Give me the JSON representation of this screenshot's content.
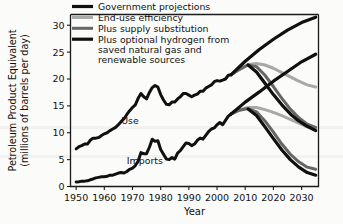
{
  "chart_data": {
    "type": "line",
    "title": "",
    "xlabel": "Year",
    "ylabel": "Petroleum Product Equivalent (millions of barrels per day)",
    "ylabel_line1": "Petroleum Product Equivalent",
    "ylabel_line2": "(millions of barrels per day)",
    "xlim": [
      1948,
      2036
    ],
    "ylim": [
      0,
      32
    ],
    "grid": false,
    "legend_position": "top-left-inside",
    "xticks": [
      1950,
      1960,
      1970,
      1980,
      1990,
      2000,
      2010,
      2020,
      2030
    ],
    "xtick_labels": [
      "1950",
      "1960",
      "1970",
      "1980",
      "1990",
      "2000",
      "2010",
      "2020",
      "2030"
    ],
    "yticks": [
      0,
      5,
      10,
      15,
      20,
      25,
      30
    ],
    "ytick_labels": [
      "0",
      "5",
      "10",
      "15",
      "20",
      "25",
      "30"
    ],
    "annotations": [
      {
        "text": "Use",
        "x": 1966,
        "y": 11.6
      },
      {
        "text": "Imports",
        "x": 1968,
        "y": 4.2
      }
    ],
    "legend": [
      {
        "label": "Government projections",
        "color": "#101010",
        "width": 3.2
      },
      {
        "label": "End-use efficiency",
        "color": "#a8a8a8",
        "width": 3.0
      },
      {
        "label": "Plus supply substitution",
        "color": "#666666",
        "width": 3.0
      },
      {
        "label": "Plus optional hydrogen from saved natural gas and renewable sources",
        "color": "#101010",
        "width": 3.2
      }
    ],
    "legend_labels_wrapped": [
      [
        "Government projections"
      ],
      [
        "End-use efficiency"
      ],
      [
        "Plus supply substitution"
      ],
      [
        "Plus optional hydrogen from",
        "saved natural gas and",
        "renewable sources"
      ]
    ],
    "series": [
      {
        "name": "Use (historical)",
        "color": "#101010",
        "width": 3.0,
        "points": [
          [
            1950,
            7.0
          ],
          [
            1951,
            7.4
          ],
          [
            1952,
            7.6
          ],
          [
            1953,
            7.9
          ],
          [
            1954,
            7.9
          ],
          [
            1955,
            8.6
          ],
          [
            1956,
            9.0
          ],
          [
            1957,
            9.0
          ],
          [
            1958,
            9.1
          ],
          [
            1959,
            9.5
          ],
          [
            1960,
            9.8
          ],
          [
            1961,
            10.0
          ],
          [
            1962,
            10.4
          ],
          [
            1963,
            10.7
          ],
          [
            1964,
            11.0
          ],
          [
            1965,
            11.5
          ],
          [
            1966,
            12.1
          ],
          [
            1967,
            12.6
          ],
          [
            1968,
            13.4
          ],
          [
            1969,
            14.1
          ],
          [
            1970,
            14.7
          ],
          [
            1971,
            15.2
          ],
          [
            1972,
            16.4
          ],
          [
            1973,
            17.3
          ],
          [
            1974,
            16.7
          ],
          [
            1975,
            16.3
          ],
          [
            1976,
            17.5
          ],
          [
            1977,
            18.4
          ],
          [
            1978,
            18.8
          ],
          [
            1979,
            18.5
          ],
          [
            1980,
            17.1
          ],
          [
            1981,
            16.1
          ],
          [
            1982,
            15.3
          ],
          [
            1983,
            15.2
          ],
          [
            1984,
            15.7
          ],
          [
            1985,
            15.7
          ],
          [
            1986,
            16.3
          ],
          [
            1987,
            16.7
          ],
          [
            1988,
            17.3
          ],
          [
            1989,
            17.3
          ],
          [
            1990,
            17.0
          ],
          [
            1991,
            16.7
          ],
          [
            1992,
            17.0
          ],
          [
            1993,
            17.2
          ],
          [
            1994,
            17.7
          ],
          [
            1995,
            17.7
          ],
          [
            1996,
            18.3
          ],
          [
            1997,
            18.6
          ],
          [
            1998,
            18.9
          ],
          [
            1999,
            19.5
          ],
          [
            2000,
            19.7
          ],
          [
            2001,
            19.6
          ],
          [
            2002,
            19.8
          ],
          [
            2003,
            20.0
          ],
          [
            2004,
            20.7
          ],
          [
            2005,
            20.8
          ]
        ]
      },
      {
        "name": "Imports (historical)",
        "color": "#101010",
        "width": 3.0,
        "points": [
          [
            1950,
            0.85
          ],
          [
            1951,
            0.9
          ],
          [
            1952,
            1.0
          ],
          [
            1953,
            1.0
          ],
          [
            1954,
            1.05
          ],
          [
            1955,
            1.25
          ],
          [
            1956,
            1.4
          ],
          [
            1957,
            1.6
          ],
          [
            1958,
            1.7
          ],
          [
            1959,
            1.8
          ],
          [
            1960,
            1.8
          ],
          [
            1961,
            1.9
          ],
          [
            1962,
            2.1
          ],
          [
            1963,
            2.1
          ],
          [
            1964,
            2.3
          ],
          [
            1965,
            2.5
          ],
          [
            1966,
            2.6
          ],
          [
            1967,
            2.5
          ],
          [
            1968,
            2.8
          ],
          [
            1969,
            3.2
          ],
          [
            1970,
            3.4
          ],
          [
            1971,
            3.9
          ],
          [
            1972,
            4.7
          ],
          [
            1973,
            6.3
          ],
          [
            1974,
            6.1
          ],
          [
            1975,
            6.1
          ],
          [
            1976,
            7.3
          ],
          [
            1977,
            8.8
          ],
          [
            1978,
            8.4
          ],
          [
            1979,
            8.5
          ],
          [
            1980,
            6.9
          ],
          [
            1981,
            6.0
          ],
          [
            1982,
            5.1
          ],
          [
            1983,
            5.0
          ],
          [
            1984,
            5.4
          ],
          [
            1985,
            5.1
          ],
          [
            1986,
            6.2
          ],
          [
            1987,
            6.7
          ],
          [
            1988,
            7.4
          ],
          [
            1989,
            8.1
          ],
          [
            1990,
            8.0
          ],
          [
            1991,
            7.6
          ],
          [
            1992,
            7.9
          ],
          [
            1993,
            8.6
          ],
          [
            1994,
            9.0
          ],
          [
            1995,
            8.8
          ],
          [
            1996,
            9.5
          ],
          [
            1997,
            10.2
          ],
          [
            1998,
            10.7
          ],
          [
            1999,
            10.9
          ],
          [
            2000,
            11.5
          ],
          [
            2001,
            11.9
          ],
          [
            2002,
            11.5
          ],
          [
            2003,
            12.3
          ],
          [
            2004,
            13.1
          ],
          [
            2005,
            13.5
          ]
        ]
      },
      {
        "name": "Government projections (use)",
        "color": "#101010",
        "width": 3.2,
        "points": [
          [
            2005,
            20.8
          ],
          [
            2010,
            23.3
          ],
          [
            2015,
            25.5
          ],
          [
            2020,
            27.4
          ],
          [
            2025,
            29.1
          ],
          [
            2030,
            30.5
          ],
          [
            2035,
            31.5
          ]
        ]
      },
      {
        "name": "Government projections (imports)",
        "color": "#101010",
        "width": 3.2,
        "points": [
          [
            2005,
            13.5
          ],
          [
            2010,
            15.7
          ],
          [
            2015,
            17.6
          ],
          [
            2020,
            19.6
          ],
          [
            2025,
            21.4
          ],
          [
            2030,
            23.2
          ],
          [
            2035,
            24.6
          ]
        ]
      },
      {
        "name": "End-use efficiency (use)",
        "color": "#a8a8a8",
        "width": 3.0,
        "points": [
          [
            2005,
            20.8
          ],
          [
            2008,
            21.8
          ],
          [
            2011,
            22.7
          ],
          [
            2014,
            22.9
          ],
          [
            2017,
            22.6
          ],
          [
            2020,
            22.0
          ],
          [
            2023,
            21.2
          ],
          [
            2026,
            20.4
          ],
          [
            2029,
            19.6
          ],
          [
            2032,
            18.9
          ],
          [
            2035,
            18.5
          ]
        ]
      },
      {
        "name": "End-use efficiency (imports)",
        "color": "#a8a8a8",
        "width": 3.0,
        "points": [
          [
            2005,
            13.5
          ],
          [
            2008,
            14.3
          ],
          [
            2011,
            14.7
          ],
          [
            2014,
            14.7
          ],
          [
            2017,
            14.3
          ],
          [
            2020,
            13.8
          ],
          [
            2023,
            13.2
          ],
          [
            2026,
            12.5
          ],
          [
            2029,
            11.8
          ],
          [
            2032,
            11.1
          ],
          [
            2035,
            10.6
          ]
        ]
      },
      {
        "name": "Plus supply substitution (use)",
        "color": "#666666",
        "width": 3.0,
        "points": [
          [
            2005,
            20.8
          ],
          [
            2008,
            21.8
          ],
          [
            2011,
            22.6
          ],
          [
            2014,
            22.3
          ],
          [
            2017,
            20.7
          ],
          [
            2020,
            18.6
          ],
          [
            2023,
            16.4
          ],
          [
            2026,
            14.4
          ],
          [
            2029,
            12.8
          ],
          [
            2032,
            11.6
          ],
          [
            2035,
            11.0
          ]
        ]
      },
      {
        "name": "Plus supply substitution (imports)",
        "color": "#666666",
        "width": 3.0,
        "points": [
          [
            2005,
            13.5
          ],
          [
            2008,
            14.2
          ],
          [
            2011,
            14.5
          ],
          [
            2014,
            13.9
          ],
          [
            2017,
            12.2
          ],
          [
            2020,
            10.1
          ],
          [
            2023,
            7.9
          ],
          [
            2026,
            6.0
          ],
          [
            2029,
            4.6
          ],
          [
            2032,
            3.6
          ],
          [
            2035,
            3.2
          ]
        ]
      },
      {
        "name": "Plus optional hydrogen (use)",
        "color": "#101010",
        "width": 3.2,
        "points": [
          [
            2011,
            22.6
          ],
          [
            2014,
            21.3
          ],
          [
            2017,
            19.2
          ],
          [
            2020,
            17.1
          ],
          [
            2023,
            15.2
          ],
          [
            2026,
            13.5
          ],
          [
            2029,
            12.2
          ],
          [
            2032,
            11.2
          ],
          [
            2035,
            10.4
          ]
        ]
      },
      {
        "name": "Plus optional hydrogen (imports)",
        "color": "#101010",
        "width": 3.2,
        "points": [
          [
            2011,
            14.4
          ],
          [
            2014,
            13.2
          ],
          [
            2017,
            11.1
          ],
          [
            2020,
            8.9
          ],
          [
            2023,
            6.8
          ],
          [
            2026,
            5.0
          ],
          [
            2029,
            3.6
          ],
          [
            2032,
            2.6
          ],
          [
            2035,
            2.1
          ]
        ]
      }
    ]
  }
}
